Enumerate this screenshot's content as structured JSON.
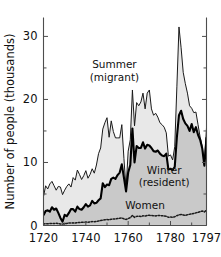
{
  "chart_data": {
    "type": "area",
    "title": "",
    "subtitle": "",
    "xlabel": "",
    "ylabel": "Number of people (thousands)",
    "xlim": [
      1720,
      1797
    ],
    "ylim": [
      0,
      33
    ],
    "grid": false,
    "legend_position": "inline-annotations",
    "xticks": [
      1720,
      1740,
      1760,
      1780,
      1797
    ],
    "xtick_labels": [
      "1720",
      "1740",
      "1760",
      "1780",
      "1797"
    ],
    "x_minor_ticks": [
      1730,
      1750,
      1770,
      1790
    ],
    "yticks": [
      0,
      10,
      20,
      30
    ],
    "ytick_labels": [
      "0",
      "10",
      "20",
      "30"
    ],
    "y_minor_ticks": [
      5,
      15,
      25
    ],
    "annotations": [
      {
        "name": "summer-label",
        "text": "Summer",
        "x": 1753.5,
        "y": 25.0
      },
      {
        "name": "summer-sublabel",
        "text": "(migrant)",
        "x": 1753.5,
        "y": 23.0
      },
      {
        "name": "winter-label",
        "text": "Winter",
        "x": 1777.0,
        "y": 8.2
      },
      {
        "name": "winter-sublabel",
        "text": "(resident)",
        "x": 1777.0,
        "y": 6.2
      },
      {
        "name": "women-label",
        "text": "Women",
        "x": 1768.0,
        "y": 2.6
      }
    ],
    "colors": {
      "summer_fill": "#e8e8e8",
      "winter_fill": "#c9c9c9",
      "summer_line": "#1a1a1a",
      "winter_line": "#000000",
      "women_line": "#1a1a1a",
      "axis": "#4d4d4d",
      "background": "#ffffff"
    },
    "x": [
      1720,
      1721,
      1722,
      1723,
      1724,
      1725,
      1726,
      1727,
      1728,
      1729,
      1730,
      1731,
      1732,
      1733,
      1734,
      1735,
      1736,
      1737,
      1738,
      1739,
      1740,
      1741,
      1742,
      1743,
      1744,
      1745,
      1746,
      1747,
      1748,
      1749,
      1750,
      1751,
      1752,
      1753,
      1754,
      1755,
      1756,
      1757,
      1758,
      1759,
      1760,
      1761,
      1762,
      1763,
      1764,
      1765,
      1766,
      1767,
      1768,
      1769,
      1770,
      1771,
      1772,
      1773,
      1774,
      1775,
      1776,
      1777,
      1778,
      1779,
      1780,
      1781,
      1782,
      1783,
      1784,
      1785,
      1786,
      1787,
      1788,
      1789,
      1790,
      1791,
      1792,
      1793,
      1794,
      1795,
      1796,
      1797
    ],
    "series": [
      {
        "name": "Summer (migrant)",
        "key": "summer",
        "units": "thousands of people",
        "values": [
          4.6,
          6.3,
          5.8,
          6.6,
          7.0,
          6.3,
          5.6,
          6.2,
          6.1,
          4.9,
          5.6,
          6.2,
          6.6,
          6.1,
          7.6,
          7.2,
          8.8,
          8.1,
          7.3,
          7.9,
          8.7,
          7.5,
          8.1,
          9.0,
          8.3,
          9.6,
          11.4,
          12.3,
          15.3,
          16.3,
          17.1,
          14.0,
          16.6,
          14.9,
          13.9,
          13.9,
          13.9,
          16.0,
          10.6,
          5.8,
          11.8,
          13.6,
          21.5,
          15.8,
          19.5,
          19.0,
          19.6,
          21.0,
          18.5,
          21.0,
          21.5,
          18.5,
          17.5,
          17.8,
          17.2,
          16.3,
          16.0,
          15.6,
          14.7,
          11.0,
          11.2,
          10.4,
          12.5,
          22.0,
          31.5,
          28.2,
          24.3,
          22.5,
          21.0,
          19.0,
          18.6,
          17.9,
          18.0,
          16.0,
          14.0,
          12.5,
          9.6,
          15.5
        ]
      },
      {
        "name": "Winter (resident)",
        "key": "winter",
        "units": "thousands of people",
        "values": [
          1.6,
          2.3,
          2.4,
          2.2,
          2.9,
          2.5,
          2.7,
          2.0,
          1.2,
          0.6,
          1.7,
          1.5,
          2.0,
          2.6,
          2.6,
          2.2,
          3.0,
          2.6,
          2.5,
          2.9,
          3.4,
          3.0,
          3.2,
          3.9,
          3.5,
          3.6,
          4.0,
          4.3,
          6.7,
          6.1,
          6.5,
          6.4,
          7.4,
          7.6,
          7.4,
          8.0,
          8.4,
          9.7,
          7.6,
          5.4,
          8.4,
          9.6,
          15.4,
          10.0,
          12.6,
          12.3,
          12.3,
          13.2,
          12.2,
          12.8,
          12.7,
          12.3,
          11.8,
          11.7,
          11.9,
          11.4,
          11.1,
          11.0,
          11.4,
          8.9,
          9.0,
          8.8,
          9.3,
          14.0,
          17.5,
          18.2,
          16.9,
          16.2,
          15.8,
          15.0,
          16.1,
          14.8,
          15.6,
          14.4,
          13.6,
          12.2,
          9.5,
          14.0
        ]
      },
      {
        "name": "Women",
        "key": "women",
        "units": "thousands of people",
        "values": [
          0.25,
          0.3,
          0.28,
          0.32,
          0.3,
          0.3,
          0.35,
          0.3,
          0.25,
          0.22,
          0.3,
          0.33,
          0.38,
          0.4,
          0.42,
          0.38,
          0.45,
          0.48,
          0.5,
          0.52,
          0.55,
          0.52,
          0.58,
          0.62,
          0.6,
          0.66,
          0.72,
          0.78,
          0.85,
          0.9,
          0.95,
          0.92,
          1.0,
          1.05,
          1.02,
          1.1,
          1.15,
          1.2,
          1.05,
          0.95,
          1.1,
          1.25,
          1.6,
          1.3,
          1.45,
          1.5,
          1.42,
          1.55,
          1.5,
          1.6,
          1.62,
          1.58,
          1.55,
          1.52,
          1.6,
          1.58,
          1.55,
          1.5,
          1.45,
          1.3,
          1.35,
          1.3,
          1.4,
          1.55,
          1.7,
          1.75,
          1.68,
          1.6,
          1.72,
          1.78,
          1.85,
          1.9,
          2.0,
          2.1,
          2.2,
          2.3,
          2.15,
          2.45
        ]
      }
    ]
  }
}
